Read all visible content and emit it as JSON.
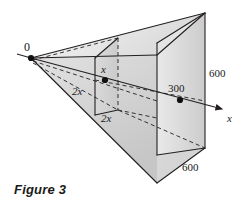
{
  "figure": {
    "caption": "Figure 3",
    "colors": {
      "stroke": "#231f20",
      "face_light": "#ededed",
      "face_mid": "#dedede",
      "face_dark": "#cfcfcf",
      "background": "#ffffff",
      "text": "#1a1a1a"
    },
    "labels": [
      {
        "id": "origin",
        "text": "0",
        "x": 24,
        "y": 43,
        "italic": false
      },
      {
        "id": "cross-section-x",
        "text": "x",
        "x": 101,
        "y": 67,
        "italic": true
      },
      {
        "id": "height-2x-left",
        "text": "2x",
        "x": 73,
        "y": 88,
        "italic": true
      },
      {
        "id": "depth-2x-bottom",
        "text": "2x",
        "x": 102,
        "y": 114,
        "italic": true
      },
      {
        "id": "distance-300",
        "text": "300",
        "x": 170,
        "y": 84,
        "italic": false
      },
      {
        "id": "height-600-right",
        "text": "600",
        "x": 209,
        "y": 69,
        "italic": false
      },
      {
        "id": "depth-600-bottom",
        "text": "600",
        "x": 183,
        "y": 163,
        "italic": false
      },
      {
        "id": "axis-x",
        "text": "x",
        "x": 228,
        "y": 115,
        "italic": true
      }
    ],
    "points": [
      {
        "id": "origin-point",
        "x": 31,
        "y": 58
      },
      {
        "id": "x-point",
        "x": 105,
        "y": 80
      },
      {
        "id": "point-300",
        "x": 180,
        "y": 100
      }
    ],
    "axis": {
      "label": "x",
      "from_x": 31,
      "from_y": 58,
      "to_x": 228,
      "to_y": 110
    }
  }
}
